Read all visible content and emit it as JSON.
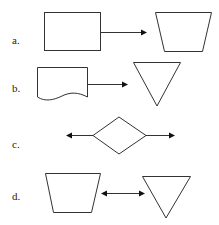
{
  "options": [
    {
      "label": "a.",
      "left_shape": "rectangle",
      "connector": "arrow-right",
      "right_shape": "trapezoid"
    },
    {
      "label": "b.",
      "left_shape": "document",
      "connector": "arrow-right",
      "right_shape": "inverted-triangle"
    },
    {
      "label": "c.",
      "left_shape": "diamond",
      "connector": "arrows-both-sides-outward",
      "right_shape": ""
    },
    {
      "label": "d.",
      "left_shape": "trapezoid",
      "connector": "double-headed-arrow",
      "right_shape": "inverted-triangle"
    }
  ],
  "colors": {
    "stroke": "#333333",
    "background": "#ffffff"
  }
}
